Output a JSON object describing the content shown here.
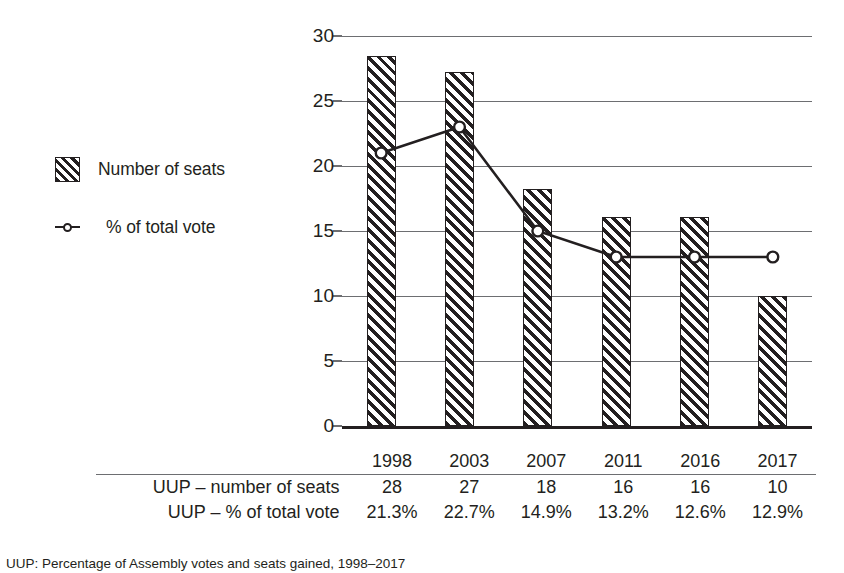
{
  "legend": {
    "items": [
      {
        "label": "Number of seats",
        "marker": "hatched-square-swatch"
      },
      {
        "label": "% of total vote",
        "marker": "line-with-circle-marker"
      }
    ]
  },
  "table": {
    "header_blank": "",
    "years": [
      "1998",
      "2003",
      "2007",
      "2011",
      "2016",
      "2017"
    ],
    "rows": [
      {
        "label": "UUP – number of seats",
        "values": [
          "28",
          "27",
          "18",
          "16",
          "16",
          "10"
        ]
      },
      {
        "label": "UUP – % of total vote",
        "values": [
          "21.3%",
          "22.7%",
          "14.9%",
          "13.2%",
          "12.6%",
          "12.9%"
        ]
      }
    ]
  },
  "caption": "UUP: Percentage of Assembly votes and seats gained, 1998–2017",
  "colors": {
    "ink": "#231f20",
    "gridline": "#6d6e71",
    "background": "#ffffff"
  },
  "chart_data": {
    "type": "bar",
    "title": "",
    "xlabel": "",
    "ylabel": "",
    "categories": [
      "1998",
      "2003",
      "2007",
      "2011",
      "2016",
      "2017"
    ],
    "ylim": [
      0,
      30
    ],
    "yticks": [
      0,
      5,
      10,
      15,
      20,
      25,
      30
    ],
    "grid": true,
    "legend_position": "left-outside",
    "series": [
      {
        "name": "Number of seats",
        "type": "bar",
        "values": [
          28.5,
          27.2,
          18.2,
          16.1,
          16.1,
          10.0
        ]
      },
      {
        "name": "% of total vote",
        "type": "line",
        "values": [
          21,
          23,
          15,
          13,
          13,
          13
        ]
      }
    ]
  }
}
